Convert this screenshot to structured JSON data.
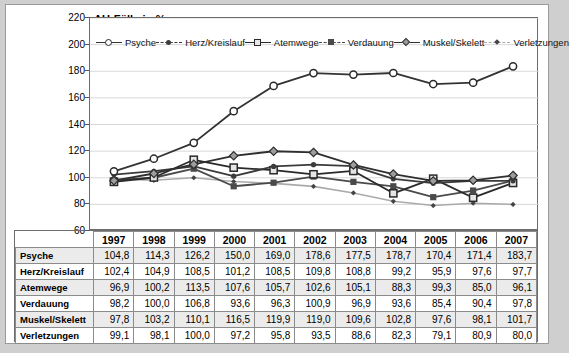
{
  "chart_data": {
    "type": "line",
    "title": "AU-Fälle in %",
    "xlabel": "",
    "ylabel": "",
    "ylim": [
      60,
      220
    ],
    "yticks": [
      60,
      80,
      100,
      120,
      140,
      160,
      180,
      200,
      220
    ],
    "grid": true,
    "legend_position": "top-inside",
    "categories": [
      "1997",
      "1998",
      "1999",
      "2000",
      "2001",
      "2002",
      "2003",
      "2004",
      "2005",
      "2006",
      "2007"
    ],
    "series": [
      {
        "name": "Psyche",
        "marker": "open-circle",
        "color": "#333333",
        "values": [
          104.8,
          114.3,
          126.2,
          150.0,
          169.0,
          178.6,
          177.5,
          178.7,
          170.4,
          171.4,
          183.7
        ]
      },
      {
        "name": "Herz/Kreislauf",
        "marker": "filled-circle",
        "color": "#3b3b3b",
        "values": [
          102.4,
          104.9,
          108.5,
          101.2,
          108.5,
          109.8,
          108.8,
          99.2,
          95.9,
          97.6,
          97.7
        ]
      },
      {
        "name": "Atemwege",
        "marker": "open-square",
        "color": "#2a2a2a",
        "values": [
          96.9,
          100.2,
          113.5,
          107.6,
          105.7,
          102.6,
          105.1,
          88.3,
          99.3,
          85.0,
          96.1
        ]
      },
      {
        "name": "Verdauung",
        "marker": "filled-square",
        "color": "#4a4a4a",
        "values": [
          98.2,
          100.0,
          106.8,
          93.6,
          96.3,
          100.9,
          96.9,
          93.6,
          85.4,
          90.4,
          97.8
        ]
      },
      {
        "name": "Muskel/Skelett",
        "marker": "diamond",
        "color": "#2f2f2f",
        "values": [
          97.8,
          103.2,
          110.1,
          116.5,
          119.9,
          119.0,
          109.6,
          102.8,
          97.6,
          98.1,
          101.7
        ]
      },
      {
        "name": "Verletzungen",
        "marker": "small-diamond",
        "color": "#aaaaaa",
        "values": [
          99.1,
          98.1,
          100.0,
          97.2,
          95.8,
          93.5,
          88.6,
          82.3,
          79.1,
          80.9,
          80.0
        ]
      }
    ]
  },
  "legend": {
    "items": [
      {
        "label": "Psyche",
        "marker": "open-circle-icon"
      },
      {
        "label": "Herz/Kreislauf",
        "marker": "filled-circle-icon"
      },
      {
        "label": "Atemwege",
        "marker": "open-square-icon"
      },
      {
        "label": "Verdauung",
        "marker": "filled-square-icon"
      },
      {
        "label": "Muskel/Skelett",
        "marker": "diamond-icon"
      },
      {
        "label": "Verletzungen",
        "marker": "small-diamond-icon"
      }
    ]
  },
  "table": {
    "columns": [
      "",
      "1997",
      "1998",
      "1999",
      "2000",
      "2001",
      "2002",
      "2003",
      "2004",
      "2005",
      "2006",
      "2007"
    ],
    "rows": [
      {
        "label": "Psyche",
        "values": [
          "104,8",
          "114,3",
          "126,2",
          "150,0",
          "169,0",
          "178,6",
          "177,5",
          "178,7",
          "170,4",
          "171,4",
          "183,7"
        ]
      },
      {
        "label": "Herz/Kreislauf",
        "values": [
          "102,4",
          "104,9",
          "108,5",
          "101,2",
          "108,5",
          "109,8",
          "108,8",
          "99,2",
          "95,9",
          "97,6",
          "97,7"
        ]
      },
      {
        "label": "Atemwege",
        "values": [
          "96,9",
          "100,2",
          "113,5",
          "107,6",
          "105,7",
          "102,6",
          "105,1",
          "88,3",
          "99,3",
          "85,0",
          "96,1"
        ]
      },
      {
        "label": "Verdauung",
        "values": [
          "98,2",
          "100,0",
          "106,8",
          "93,6",
          "96,3",
          "100,9",
          "96,9",
          "93,6",
          "85,4",
          "90,4",
          "97,8"
        ]
      },
      {
        "label": "Muskel/Skelett",
        "values": [
          "97,8",
          "103,2",
          "110,1",
          "116,5",
          "119,9",
          "119,0",
          "109,6",
          "102,8",
          "97,6",
          "98,1",
          "101,7"
        ]
      },
      {
        "label": "Verletzungen",
        "values": [
          "99,1",
          "98,1",
          "100,0",
          "97,2",
          "95,8",
          "93,5",
          "88,6",
          "82,3",
          "79,1",
          "80,9",
          "80,0"
        ]
      }
    ]
  }
}
